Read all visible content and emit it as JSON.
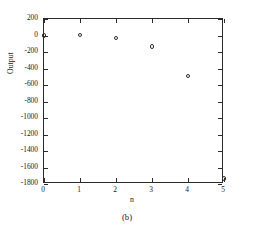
{
  "figure": {
    "caption": "(b)"
  },
  "chart_data": {
    "type": "scatter",
    "title": "",
    "xlabel": "n",
    "ylabel": "Output",
    "xlim": [
      0,
      5
    ],
    "ylim": [
      -1800,
      200
    ],
    "grid": false,
    "legend": null,
    "marker_style": "open-circle",
    "marker_color": "#2e2e2e",
    "x": [
      0,
      1,
      2,
      3,
      4,
      5
    ],
    "y": [
      0,
      5,
      -30,
      -130,
      -490,
      -1730
    ],
    "xticks": [
      0,
      1,
      2,
      3,
      4,
      5
    ],
    "xtick_labels": [
      "0",
      "1",
      "2",
      "3",
      "4",
      "5"
    ],
    "yticks": [
      200,
      0,
      -200,
      -400,
      -600,
      -800,
      -1000,
      -1200,
      -1400,
      -1600,
      -1800
    ],
    "ytick_labels": [
      "200",
      "0",
      "-200",
      "-400",
      "-600",
      "-800",
      "-1000",
      "-1200",
      "-1400",
      "-1600",
      "-1800"
    ],
    "points": [
      {
        "x": 0,
        "y": 0
      },
      {
        "x": 1,
        "y": 5
      },
      {
        "x": 2,
        "y": -30
      },
      {
        "x": 3,
        "y": -130
      },
      {
        "x": 4,
        "y": -490
      },
      {
        "x": 5,
        "y": -1730
      }
    ]
  }
}
